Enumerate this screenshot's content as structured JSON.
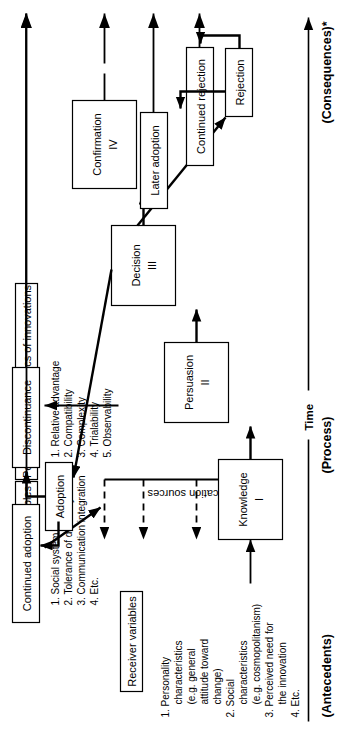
{
  "diagram": {
    "stage_labels": [
      {
        "name": "antecedents",
        "text": "(Antecedents)"
      },
      {
        "name": "process",
        "text": "(Process)"
      },
      {
        "name": "consequences",
        "text": "(Consequences)*"
      }
    ],
    "time_axis": {
      "label": "Time"
    },
    "process_boxes": [
      {
        "name": "knowledge",
        "label": "Knowledge",
        "numeral": "I"
      },
      {
        "name": "persuasion",
        "label": "Persuasion",
        "numeral": "II"
      },
      {
        "name": "decision",
        "label": "Decision",
        "numeral": "III"
      },
      {
        "name": "confirmation",
        "label": "Confirmation",
        "numeral": "IV"
      }
    ],
    "outcome_boxes": [
      {
        "name": "adoption",
        "label": "Adoption"
      },
      {
        "name": "continued-adoption",
        "label": "Continued adoption"
      },
      {
        "name": "discontinuance",
        "label": "Discontinuance"
      },
      {
        "name": "rejection",
        "label": "Rejection"
      },
      {
        "name": "later-adoption",
        "label": "Later adoption"
      },
      {
        "name": "continued-rejection",
        "label": "Continued rejection"
      }
    ],
    "communication_sources": {
      "label": "Communication sources"
    },
    "panels": [
      {
        "name": "receiver-variables",
        "title": "Receiver variables",
        "items": [
          "1.  Personality",
          "characteristics",
          "(e.g. general",
          "attitude toward",
          "change)",
          "2.  Social",
          "characteristics",
          "(e.g. cosmopolitanism)",
          "3.  Perceived need for",
          "the innovation",
          "4.  Etc."
        ]
      },
      {
        "name": "social-system-variables",
        "title": "Social system variables",
        "items": [
          "1.  Social system norms",
          "2.  Tolerance of deviancy",
          "3.  Communication integration",
          "4.  Etc."
        ]
      },
      {
        "name": "perceived-characteristics-of-innovations",
        "title": "Perceived characteristics of innovations",
        "items": [
          "1.  Relative advantage",
          "2.  Compatibility",
          "3.  Complexity",
          "4.  Trialability",
          "5.  Observability"
        ]
      }
    ],
    "colors": {
      "stroke": "#000000",
      "fill": "#ffffff",
      "background": "#ffffff"
    }
  }
}
